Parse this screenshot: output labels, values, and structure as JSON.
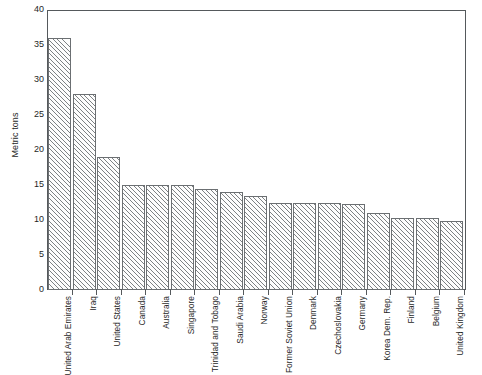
{
  "chart_data": {
    "type": "bar",
    "title": "",
    "subtitle": "",
    "xlabel": "",
    "ylabel": "Metric tons",
    "ylim": [
      0,
      40
    ],
    "yticks": [
      0,
      5,
      10,
      15,
      20,
      25,
      30,
      35,
      40
    ],
    "grid": false,
    "legend": null,
    "orientation": "vertical",
    "bar_style": "diagonal-hatch",
    "categories": [
      "United Arab Emirates",
      "Iraq",
      "United States",
      "Canada",
      "Australia",
      "Singapore",
      "Trinidad and Tobago",
      "Saudi Arabia",
      "Norway",
      "Former Soviet Union",
      "Denmark",
      "Czechoslovakia",
      "Germany",
      "Korea Dem. Rep.",
      "Finland",
      "Belgium",
      "United Kingdom"
    ],
    "values": [
      36,
      28,
      19,
      15,
      15,
      15,
      14.5,
      14,
      13.5,
      12.5,
      12.5,
      12.5,
      12.3,
      11,
      10.3,
      10.3,
      9.8
    ]
  },
  "colors": {
    "axis": "#55595c",
    "bar_outline": "#6b6f72",
    "bar_hatch": "#7d8184",
    "bar_fill": "#fdfdfd",
    "text": "#1f1f1f",
    "background": "#ffffff"
  }
}
